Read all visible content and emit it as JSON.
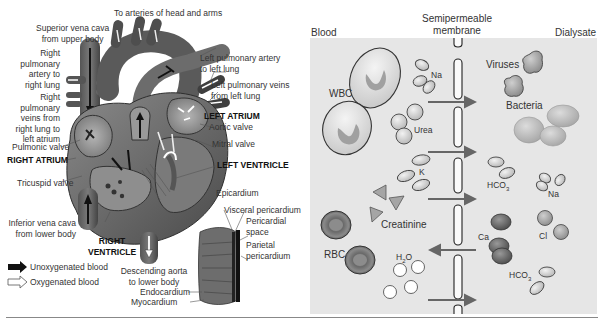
{
  "heart_diagram": {
    "labels": {
      "arteries_head_arms": "To arteries of head and arms",
      "superior_vena_cava": [
        "Superior vena cava",
        "from upper body"
      ],
      "right_pulmonary_artery": [
        "Right",
        "pulmonary",
        "artery to",
        "right lung"
      ],
      "right_pulmonary_veins": [
        "Right",
        "pulmonary",
        "veins from",
        "right lung to",
        "left atrium"
      ],
      "pulmonic_valve": "Pulmonic valve",
      "right_atrium": "RIGHT ATRIUM",
      "tricuspid_valve": "Tricuspid valve",
      "inferior_vena_cava": [
        "Inferior vena cava",
        "from lower body"
      ],
      "right_ventricle": [
        "RIGHT",
        "VENTRICLE"
      ],
      "left_pulmonary_artery": [
        "Left pulmonary artery",
        "to left lung"
      ],
      "left_pulmonary_veins": [
        "Left pulmonary veins",
        "from left lung"
      ],
      "left_atrium": "LEFT ATRIUM",
      "aortic_valve": "Aortic valve",
      "mitral_valve": "Mitral valve",
      "left_ventricle": "LEFT VENTRICLE",
      "epicardium": "Epicardium",
      "visceral_pericardium": "Visceral pericardium",
      "pericardial_space": [
        "Pericardial",
        "space"
      ],
      "parietal_pericardium": [
        "Parietal",
        "pericardium"
      ],
      "descending_aorta": [
        "Descending aorta",
        "to lower body"
      ],
      "endocardium": "Endocardium",
      "myocardium": "Myocardium"
    },
    "legend": [
      {
        "icon": "filled-arrow-icon",
        "label": "Unoxygenated blood"
      },
      {
        "icon": "outline-arrow-icon",
        "label": "Oxygenated blood"
      }
    ]
  },
  "dialysis_diagram": {
    "headers": {
      "blood": "Blood",
      "membrane": [
        "Semipermeable",
        "membrane"
      ],
      "dialysate": "Dialysate"
    },
    "particles": {
      "wbc": "WBC",
      "na_left": "Na",
      "urea": "Urea",
      "k": "K",
      "creatinine": "Creatinine",
      "rbc": "RBC",
      "h2o": "H",
      "h2o_sub": "2",
      "h2o_tail": "O",
      "viruses": "Viruses",
      "bacteria": "Bacteria",
      "hco3_top": "HCO",
      "hco3_top_sub": "3",
      "na_right": "Na",
      "ca": "Ca",
      "cl": "Cl",
      "hco3_bottom": "HCO",
      "hco3_bottom_sub": "3"
    },
    "arrows": [
      {
        "direction": "right"
      },
      {
        "direction": "right"
      },
      {
        "direction": "right"
      },
      {
        "direction": "right"
      },
      {
        "direction": "left"
      },
      {
        "direction": "right"
      }
    ],
    "colors": {
      "panel_bg": "#e6e6e6",
      "arrow": "#666666",
      "rbc": "#6e6e6e",
      "ca": "#555555"
    }
  }
}
